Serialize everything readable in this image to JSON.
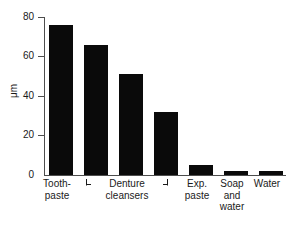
{
  "chart_data": {
    "type": "bar",
    "title": "",
    "xlabel": "",
    "ylabel": "μm",
    "ylim": [
      0,
      80
    ],
    "yticks": [
      0,
      20,
      40,
      60,
      80
    ],
    "ytick_labels": [
      "0",
      "20",
      "40",
      "60",
      "80"
    ],
    "grid": false,
    "legend": null,
    "categories": [
      "Tooth-\npaste",
      "",
      "",
      "",
      "Exp.\npaste",
      "Soap\nand\nwater",
      "Water"
    ],
    "values": [
      76,
      66,
      51,
      32,
      5,
      2,
      2
    ],
    "bar_color": "#0a0a0a",
    "annotations": [
      {
        "type": "group-bracket",
        "label": "Denture\ncleansers",
        "covers_bars": [
          1,
          2,
          3
        ]
      }
    ]
  },
  "axis": {
    "y_title": "μm",
    "ticks": [
      {
        "label": "80",
        "value": 80
      },
      {
        "label": "60",
        "value": 60
      },
      {
        "label": "40",
        "value": 40
      },
      {
        "label": "20",
        "value": 20
      },
      {
        "label": "0",
        "value": 0
      }
    ]
  },
  "x_labels": [
    {
      "text": "Tooth-\npaste"
    },
    {
      "text": "Denture\ncleansers"
    },
    {
      "text": "Exp.\npaste"
    },
    {
      "text": "Soap\nand\nwater"
    },
    {
      "text": "Water"
    }
  ]
}
